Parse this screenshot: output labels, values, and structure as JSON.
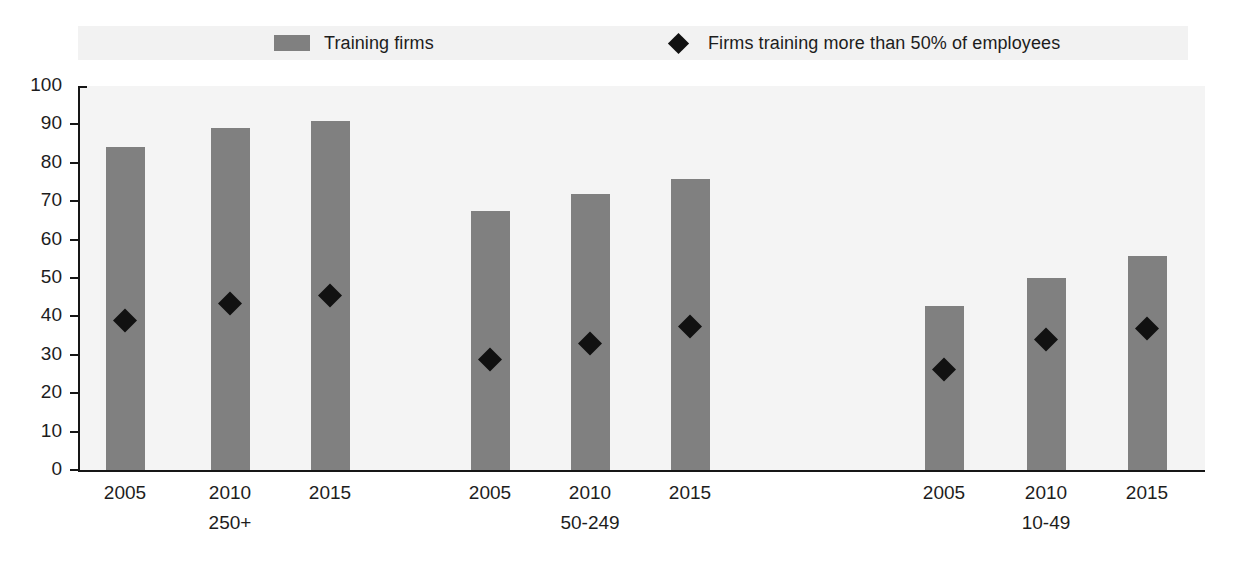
{
  "legend": {
    "items": [
      {
        "label": "Training firms",
        "marker": "square-swatch",
        "color": "#808080"
      },
      {
        "label": "Firms training more than 50% of employees",
        "marker": "diamond-marker",
        "color": "#111111"
      }
    ]
  },
  "chart_data": {
    "type": "bar",
    "title": "",
    "xlabel": "",
    "ylabel": "",
    "ylim": [
      0,
      100
    ],
    "ytick_labels": [
      "100",
      "90",
      "80",
      "70",
      "60",
      "50",
      "40",
      "30",
      "20",
      "10",
      "0"
    ],
    "yticks": [
      100,
      90,
      80,
      70,
      60,
      50,
      40,
      30,
      20,
      10,
      0
    ],
    "grid": false,
    "legend_position": "top",
    "groups": [
      {
        "group_label": "250+",
        "categories": [
          "2005",
          "2010",
          "2015"
        ],
        "training_firms": [
          84.2,
          89.1,
          91.0
        ],
        "firms_training_more_than_50pct": [
          39.0,
          43.5,
          45.5
        ]
      },
      {
        "group_label": "50-249",
        "categories": [
          "2005",
          "2010",
          "2015"
        ],
        "training_firms": [
          67.5,
          72.0,
          75.8
        ],
        "firms_training_more_than_50pct": [
          29.0,
          33.0,
          37.6
        ]
      },
      {
        "group_label": "10-49",
        "categories": [
          "2005",
          "2010",
          "2015"
        ],
        "training_firms": [
          42.6,
          50.0,
          55.6
        ],
        "firms_training_more_than_50pct": [
          26.4,
          34.2,
          37.1
        ]
      }
    ],
    "series": [
      {
        "name": "Training firms",
        "type": "bar",
        "color": "#808080",
        "values": [
          84.2,
          89.1,
          91.0,
          67.5,
          72.0,
          75.8,
          42.6,
          50.0,
          55.6
        ]
      },
      {
        "name": "Firms training more than 50% of employees",
        "type": "scatter",
        "color": "#111111",
        "values": [
          39.0,
          43.5,
          45.5,
          29.0,
          33.0,
          37.6,
          26.4,
          34.2,
          37.1
        ]
      }
    ],
    "x_positions": [
      125,
      230,
      330,
      490,
      590,
      690,
      944,
      1046,
      1147
    ]
  }
}
